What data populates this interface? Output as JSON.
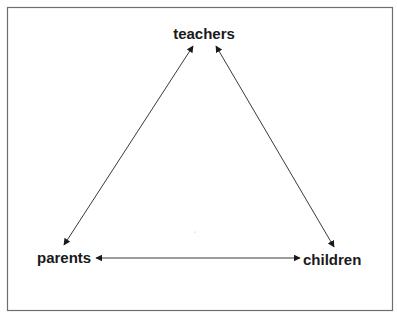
{
  "diagram": {
    "type": "relationship-triangle",
    "nodes": {
      "top": {
        "id": "teachers",
        "label": "teachers"
      },
      "left": {
        "id": "parents",
        "label": "parents"
      },
      "right": {
        "id": "children",
        "label": "children"
      }
    },
    "edges": [
      {
        "from": "teachers",
        "to": "parents",
        "direction": "bidirectional"
      },
      {
        "from": "teachers",
        "to": "children",
        "direction": "bidirectional"
      },
      {
        "from": "parents",
        "to": "children",
        "direction": "bidirectional"
      }
    ],
    "colors": {
      "frame": "#6e6e6e",
      "line": "#3a3a3a",
      "text": "#1a1a1a"
    }
  }
}
